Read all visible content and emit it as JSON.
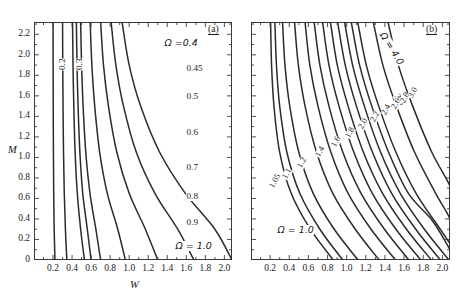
{
  "figure": {
    "width": 463,
    "height": 295,
    "background": "#ffffff",
    "line_color": "#2b2b2b",
    "frame_color": "#3a3a3a"
  },
  "axes": {
    "xlabel": "W",
    "ylabel": "M",
    "xlim": [
      0.0,
      2.08
    ],
    "ylim": [
      0.0,
      2.32
    ],
    "xticks": [
      0.2,
      0.4,
      0.6,
      0.8,
      1.0,
      1.2,
      1.4,
      1.6,
      1.8,
      2.0
    ],
    "xticklabels": [
      "0.2",
      "0.4",
      "0.6",
      "0.8",
      "1.0",
      "1.2",
      "1.4",
      "1.6",
      "1.8",
      "2.0"
    ],
    "yticks": [
      0,
      0.2,
      0.4,
      0.6,
      0.8,
      1.0,
      1.2,
      1.4,
      1.6,
      1.8,
      2.0,
      2.2
    ],
    "yticklabels": [
      "0",
      "0.2",
      "0.4",
      "0.6",
      "0.8",
      "1.0",
      "1.2",
      "1.4",
      "1.6",
      "1.8",
      "2.0",
      "2.2"
    ],
    "minor_ticks": true,
    "grid": false
  },
  "panel_a": {
    "tag": "(a)",
    "omega_symbol": "Ω",
    "header_label": "Ω =0.4",
    "foot_label": "Ω = 1.0",
    "levels": [
      0.2,
      0.3,
      0.4,
      0.45,
      0.5,
      0.6,
      0.7,
      0.8,
      0.9,
      1.0
    ],
    "labels_rotated": [
      "0.2",
      "0.3"
    ],
    "labels_right": [
      "0.45",
      "0.5",
      "0.6",
      "0.7",
      "0.8",
      "0.9"
    ],
    "axis_crossings_W": [
      0.2,
      0.3,
      0.41,
      0.45,
      0.5,
      0.6,
      0.72,
      0.81,
      0.92
    ]
  },
  "panel_b": {
    "tag": "(b)",
    "omega_symbol": "Ω",
    "header_label": "Ω = 4.0",
    "foot_label": "Ω = 1.0",
    "corner_label": "3.5",
    "levels": [
      1.05,
      1.1,
      1.2,
      1.4,
      1.6,
      1.8,
      2.0,
      2.2,
      2.4,
      2.6,
      2.8,
      3.0,
      3.5,
      4.0
    ],
    "labels_diagonal": [
      "1.05",
      "1.1",
      "1.2",
      "1.4",
      "1.6",
      "1.8",
      "2.0",
      "2.2",
      "2.4",
      "2.6",
      "2.8",
      "3.0"
    ]
  },
  "chart_data": {
    "type": "line",
    "title": "",
    "xlabel": "W",
    "ylabel": "M",
    "xlim": [
      0.0,
      2.08
    ],
    "ylim": [
      0.0,
      2.32
    ],
    "grid": false,
    "legend": "contour-labels-inline",
    "panels": [
      {
        "name": "(a)",
        "description": "Contours of Ω from 0.2 to 1.0; hyperbola-like curves asymptotic to vertical at small W and flattening toward large W.",
        "series": [
          {
            "name": "0.2",
            "x": [
              0.2,
              0.201,
              0.202,
              0.204,
              0.207,
              0.212,
              0.22
            ],
            "y": [
              2.32,
              1.9,
              1.5,
              1.05,
              0.65,
              0.3,
              0.0
            ]
          },
          {
            "name": "0.3",
            "x": [
              0.3,
              0.302,
              0.305,
              0.31,
              0.318,
              0.33,
              0.345
            ],
            "y": [
              2.32,
              1.9,
              1.5,
              1.05,
              0.65,
              0.3,
              0.0
            ]
          },
          {
            "name": "0.4",
            "x": [
              0.405,
              0.41,
              0.418,
              0.432,
              0.455,
              0.49,
              0.53
            ],
            "y": [
              2.32,
              1.9,
              1.5,
              1.05,
              0.65,
              0.3,
              0.0
            ]
          },
          {
            "name": "0.45",
            "x": [
              0.445,
              0.452,
              0.463,
              0.482,
              0.512,
              0.56,
              0.6
            ],
            "y": [
              2.32,
              1.9,
              1.5,
              1.05,
              0.65,
              0.3,
              0.0
            ]
          },
          {
            "name": "0.5",
            "x": [
              0.49,
              0.5,
              0.516,
              0.544,
              0.588,
              0.65,
              0.7
            ],
            "y": [
              2.32,
              1.9,
              1.5,
              1.05,
              0.65,
              0.3,
              0.0
            ]
          },
          {
            "name": "0.6",
            "x": [
              0.59,
              0.608,
              0.638,
              0.69,
              0.77,
              0.88,
              0.96
            ],
            "y": [
              2.32,
              1.9,
              1.5,
              1.05,
              0.65,
              0.3,
              0.0
            ]
          },
          {
            "name": "0.7",
            "x": [
              0.7,
              0.73,
              0.782,
              0.87,
              1.0,
              1.17,
              1.3
            ],
            "y": [
              2.32,
              1.9,
              1.5,
              1.05,
              0.65,
              0.3,
              0.0
            ]
          },
          {
            "name": "0.8",
            "x": [
              0.81,
              0.86,
              0.94,
              1.075,
              1.27,
              1.51,
              1.68
            ],
            "y": [
              2.32,
              1.9,
              1.5,
              1.05,
              0.65,
              0.3,
              0.0
            ]
          },
          {
            "name": "0.9",
            "x": [
              0.925,
              1.0,
              1.12,
              1.32,
              1.59,
              1.9,
              2.08
            ],
            "y": [
              2.32,
              1.9,
              1.5,
              1.05,
              0.65,
              0.3,
              0.0
            ]
          }
        ]
      },
      {
        "name": "(b)",
        "description": "Contours of Ω from 1.05 to 4.0; curves sweep from top-left downward to bottom-right, becoming straighter diagonals at higher Ω.",
        "series": [
          {
            "name": "1.05",
            "x": [
              0.205,
              0.215,
              0.24,
              0.3,
              0.42,
              0.62,
              0.86
            ],
            "y": [
              2.32,
              1.9,
              1.5,
              1.05,
              0.65,
              0.3,
              0.0
            ]
          },
          {
            "name": "1.1",
            "x": [
              0.25,
              0.266,
              0.3,
              0.375,
              0.51,
              0.72,
              0.96
            ],
            "y": [
              2.32,
              1.9,
              1.5,
              1.05,
              0.65,
              0.3,
              0.0
            ]
          },
          {
            "name": "1.2",
            "x": [
              0.33,
              0.355,
              0.405,
              0.5,
              0.65,
              0.87,
              1.12
            ],
            "y": [
              2.32,
              1.9,
              1.5,
              1.05,
              0.65,
              0.3,
              0.0
            ]
          },
          {
            "name": "1.4",
            "x": [
              0.455,
              0.495,
              0.565,
              0.685,
              0.855,
              1.09,
              1.34
            ],
            "y": [
              2.32,
              1.9,
              1.5,
              1.05,
              0.65,
              0.3,
              0.0
            ]
          },
          {
            "name": "1.6",
            "x": [
              0.565,
              0.615,
              0.7,
              0.835,
              1.015,
              1.255,
              1.51
            ],
            "y": [
              2.32,
              1.9,
              1.5,
              1.05,
              0.65,
              0.3,
              0.0
            ]
          },
          {
            "name": "1.8",
            "x": [
              0.66,
              0.72,
              0.815,
              0.96,
              1.15,
              1.395,
              1.65
            ],
            "y": [
              2.32,
              1.9,
              1.5,
              1.05,
              0.65,
              0.3,
              0.0
            ]
          },
          {
            "name": "2.0",
            "x": [
              0.748,
              0.815,
              0.92,
              1.075,
              1.268,
              1.515,
              1.775
            ],
            "y": [
              2.32,
              1.9,
              1.5,
              1.05,
              0.65,
              0.3,
              0.0
            ]
          },
          {
            "name": "2.2",
            "x": [
              0.83,
              0.902,
              1.015,
              1.175,
              1.375,
              1.625,
              1.885
            ],
            "y": [
              2.32,
              1.9,
              1.5,
              1.05,
              0.65,
              0.3,
              0.0
            ]
          },
          {
            "name": "2.4",
            "x": [
              0.905,
              0.985,
              1.102,
              1.27,
              1.47,
              1.722,
              1.98
            ],
            "y": [
              2.32,
              1.9,
              1.5,
              1.05,
              0.65,
              0.3,
              0.0
            ]
          },
          {
            "name": "2.6",
            "x": [
              0.978,
              1.062,
              1.185,
              1.355,
              1.56,
              1.812,
              2.07
            ],
            "y": [
              2.32,
              1.9,
              1.5,
              1.05,
              0.65,
              0.3,
              0.0
            ]
          },
          {
            "name": "2.8",
            "x": [
              1.048,
              1.135,
              1.262,
              1.438,
              1.645,
              1.898,
              2.08
            ],
            "y": [
              2.32,
              1.9,
              1.5,
              1.05,
              0.65,
              0.38,
              0.1
            ]
          },
          {
            "name": "3.0",
            "x": [
              1.115,
              1.205,
              1.335,
              1.515,
              1.725,
              1.978,
              2.08
            ],
            "y": [
              2.32,
              1.9,
              1.5,
              1.05,
              0.65,
              0.3,
              0.16
            ]
          },
          {
            "name": "3.5",
            "x": [
              1.278,
              1.378,
              1.52,
              1.71,
              1.93,
              2.08,
              2.08
            ],
            "y": [
              2.32,
              1.9,
              1.5,
              1.05,
              0.65,
              0.4,
              0.28
            ]
          },
          {
            "name": "4.0",
            "x": [
              1.432,
              1.54,
              1.69,
              1.89,
              2.08,
              2.08,
              2.08
            ],
            "y": [
              2.32,
              1.9,
              1.5,
              1.05,
              0.72,
              0.6,
              0.52
            ]
          }
        ]
      }
    ]
  }
}
